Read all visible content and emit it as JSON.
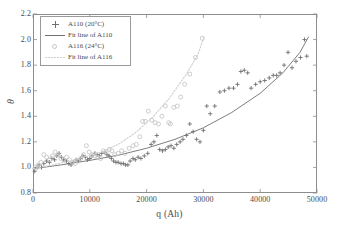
{
  "figure": {
    "background": "#ffffff",
    "frame_color": "#8d8d8d"
  },
  "axis": {
    "xlabel": "q (Ah)",
    "ylabel": "θ",
    "xticks": [
      "0",
      "10000",
      "20000",
      "30000",
      "40000",
      "50000"
    ],
    "yticks": [
      "0.8",
      "1.0",
      "1.2",
      "1.4",
      "1.6",
      "1.8",
      "2.0",
      "2.2"
    ]
  },
  "legend": {
    "entries": [
      {
        "label": "A110 (20°C)",
        "key": "plus-marker",
        "color": "#6f6f6f"
      },
      {
        "label": "Fit line of A110",
        "key": "solid-line",
        "color": "#6f6f6f"
      },
      {
        "label": "A116 (24°C)",
        "key": "circle-marker",
        "color": "#c4c4c4"
      },
      {
        "label": "Fit line of A116",
        "key": "dotted-line",
        "color": "#cfcfcf"
      }
    ]
  },
  "chart_data": {
    "type": "scatter",
    "title": "",
    "xlabel": "q (Ah)",
    "ylabel": "θ",
    "xlim": [
      0,
      50000
    ],
    "ylim": [
      0.8,
      2.2
    ],
    "xtick_step": 10000,
    "ytick_step": 0.2,
    "grid": false,
    "legend_position": "upper-left-inside",
    "series": [
      {
        "name": "A110 (20°C)",
        "type": "scatter",
        "marker": "plus",
        "color": "#6f6f6f",
        "points": [
          [
            300,
            0.97
          ],
          [
            700,
            1.0
          ],
          [
            1100,
            1.02
          ],
          [
            1500,
            1.0
          ],
          [
            1900,
            1.03
          ],
          [
            2400,
            1.05
          ],
          [
            2900,
            1.04
          ],
          [
            3300,
            1.07
          ],
          [
            3800,
            1.06
          ],
          [
            4200,
            1.09
          ],
          [
            4600,
            1.11
          ],
          [
            5000,
            1.08
          ],
          [
            5400,
            1.06
          ],
          [
            5900,
            1.05
          ],
          [
            6300,
            1.03
          ],
          [
            6700,
            1.02
          ],
          [
            7100,
            1.04
          ],
          [
            7600,
            1.06
          ],
          [
            8000,
            1.05
          ],
          [
            8400,
            1.07
          ],
          [
            8800,
            1.09
          ],
          [
            9200,
            1.08
          ],
          [
            9600,
            1.06
          ],
          [
            10000,
            1.07
          ],
          [
            10400,
            1.09
          ],
          [
            10900,
            1.11
          ],
          [
            11300,
            1.1
          ],
          [
            11700,
            1.09
          ],
          [
            12100,
            1.11
          ],
          [
            12600,
            1.12
          ],
          [
            13000,
            1.1
          ],
          [
            13400,
            1.09
          ],
          [
            13800,
            1.07
          ],
          [
            14200,
            1.05
          ],
          [
            14600,
            1.04
          ],
          [
            15000,
            1.04
          ],
          [
            15500,
            1.03
          ],
          [
            15900,
            1.03
          ],
          [
            16300,
            1.02
          ],
          [
            16700,
            1.02
          ],
          [
            17100,
            1.05
          ],
          [
            17600,
            1.07
          ],
          [
            18000,
            1.06
          ],
          [
            18500,
            1.08
          ],
          [
            19000,
            1.07
          ],
          [
            19600,
            1.09
          ],
          [
            20200,
            1.11
          ],
          [
            20800,
            1.18
          ],
          [
            21300,
            1.2
          ],
          [
            21800,
            1.25
          ],
          [
            22300,
            1.14
          ],
          [
            22800,
            1.13
          ],
          [
            23300,
            1.14
          ],
          [
            23800,
            1.16
          ],
          [
            24300,
            1.17
          ],
          [
            24800,
            1.15
          ],
          [
            25300,
            1.18
          ],
          [
            25900,
            1.2
          ],
          [
            26400,
            1.22
          ],
          [
            27000,
            1.25
          ],
          [
            27600,
            1.34
          ],
          [
            28200,
            1.28
          ],
          [
            28800,
            1.22
          ],
          [
            29400,
            1.2
          ],
          [
            30000,
            1.29
          ],
          [
            30600,
            1.48
          ],
          [
            31200,
            1.42
          ],
          [
            32000,
            1.48
          ],
          [
            32900,
            1.59
          ],
          [
            33700,
            1.6
          ],
          [
            34500,
            1.62
          ],
          [
            35300,
            1.62
          ],
          [
            36000,
            1.65
          ],
          [
            36600,
            1.75
          ],
          [
            37200,
            1.76
          ],
          [
            37800,
            1.74
          ],
          [
            38400,
            1.62
          ],
          [
            39200,
            1.65
          ],
          [
            40000,
            1.67
          ],
          [
            40800,
            1.68
          ],
          [
            41600,
            1.7
          ],
          [
            42300,
            1.72
          ],
          [
            42900,
            1.72
          ],
          [
            43500,
            1.74
          ],
          [
            44200,
            1.8
          ],
          [
            44900,
            1.9
          ],
          [
            45600,
            1.78
          ],
          [
            46300,
            1.83
          ],
          [
            47100,
            1.86
          ],
          [
            47800,
            2.0
          ],
          [
            48200,
            1.87
          ]
        ]
      },
      {
        "name": "Fit line of A110",
        "type": "line",
        "style": "solid",
        "color": "#6f6f6f",
        "points": [
          [
            0,
            0.99
          ],
          [
            5000,
            1.02
          ],
          [
            10000,
            1.055
          ],
          [
            15000,
            1.095
          ],
          [
            20000,
            1.15
          ],
          [
            25000,
            1.22
          ],
          [
            30000,
            1.31
          ],
          [
            35000,
            1.43
          ],
          [
            40000,
            1.58
          ],
          [
            44000,
            1.74
          ],
          [
            47000,
            1.9
          ],
          [
            48500,
            2.02
          ]
        ]
      },
      {
        "name": "A116 (24°C)",
        "type": "scatter",
        "marker": "circle",
        "color": "#c4c4c4",
        "points": [
          [
            400,
            1.0
          ],
          [
            900,
            1.02
          ],
          [
            1400,
            1.04
          ],
          [
            1900,
            1.1
          ],
          [
            2400,
            1.08
          ],
          [
            2900,
            1.06
          ],
          [
            3400,
            1.09
          ],
          [
            3900,
            1.12
          ],
          [
            4400,
            1.1
          ],
          [
            4900,
            1.07
          ],
          [
            5400,
            1.06
          ],
          [
            5900,
            1.08
          ],
          [
            6400,
            1.06
          ],
          [
            6900,
            1.04
          ],
          [
            7400,
            1.03
          ],
          [
            7900,
            1.05
          ],
          [
            8400,
            1.07
          ],
          [
            8900,
            1.1
          ],
          [
            9400,
            1.17
          ],
          [
            9900,
            1.12
          ],
          [
            10400,
            1.1
          ],
          [
            10900,
            1.09
          ],
          [
            11400,
            1.08
          ],
          [
            11900,
            1.07
          ],
          [
            12400,
            1.13
          ],
          [
            12900,
            1.12
          ],
          [
            13400,
            1.14
          ],
          [
            13900,
            1.13
          ],
          [
            14400,
            1.1
          ],
          [
            15000,
            1.11
          ],
          [
            15600,
            1.13
          ],
          [
            16200,
            1.11
          ],
          [
            16900,
            1.15
          ],
          [
            17600,
            1.17
          ],
          [
            18200,
            1.18
          ],
          [
            18800,
            1.24
          ],
          [
            19300,
            1.36
          ],
          [
            19800,
            1.36
          ],
          [
            20300,
            1.44
          ],
          [
            20900,
            1.37
          ],
          [
            21500,
            1.35
          ],
          [
            22100,
            1.34
          ],
          [
            22700,
            1.4
          ],
          [
            23300,
            1.48
          ],
          [
            23900,
            1.35
          ],
          [
            24200,
            1.34
          ],
          [
            24800,
            1.47
          ],
          [
            25400,
            1.48
          ],
          [
            26000,
            1.55
          ],
          [
            26700,
            1.65
          ],
          [
            27600,
            1.73
          ],
          [
            28600,
            1.86
          ],
          [
            29800,
            2.01
          ]
        ]
      },
      {
        "name": "Fit line of A116",
        "type": "line",
        "style": "dotted",
        "color": "#cfcfcf",
        "points": [
          [
            0,
            0.99
          ],
          [
            3000,
            1.015
          ],
          [
            6000,
            1.045
          ],
          [
            9000,
            1.08
          ],
          [
            12000,
            1.12
          ],
          [
            15000,
            1.18
          ],
          [
            18000,
            1.27
          ],
          [
            21000,
            1.39
          ],
          [
            24000,
            1.54
          ],
          [
            27000,
            1.73
          ],
          [
            29000,
            1.88
          ],
          [
            30100,
            2.02
          ]
        ]
      }
    ]
  }
}
